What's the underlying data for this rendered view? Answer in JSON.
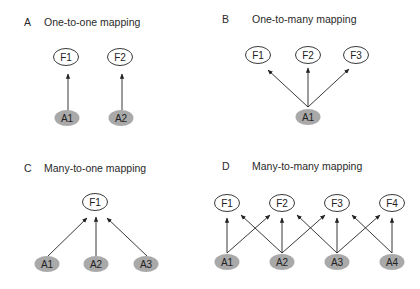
{
  "colors": {
    "node_outline": "#222222",
    "node_shaded_fill": "#a9a9a9",
    "arrow": "#222222"
  },
  "panels": [
    {
      "letter": "A",
      "title": "One-to-one mapping",
      "top_nodes": [
        "F1",
        "F2"
      ],
      "bottom_nodes": [
        "A1",
        "A2"
      ],
      "edges": [
        [
          "A1",
          "F1"
        ],
        [
          "A2",
          "F2"
        ]
      ]
    },
    {
      "letter": "B",
      "title": "One-to-many mapping",
      "top_nodes": [
        "F1",
        "F2",
        "F3"
      ],
      "bottom_nodes": [
        "A1"
      ],
      "edges": [
        [
          "A1",
          "F1"
        ],
        [
          "A1",
          "F2"
        ],
        [
          "A1",
          "F3"
        ]
      ]
    },
    {
      "letter": "C",
      "title": "Many-to-one mapping",
      "top_nodes": [
        "F1"
      ],
      "bottom_nodes": [
        "A1",
        "A2",
        "A3"
      ],
      "edges": [
        [
          "A1",
          "F1"
        ],
        [
          "A2",
          "F1"
        ],
        [
          "A3",
          "F1"
        ]
      ]
    },
    {
      "letter": "D",
      "title": "Many-to-many mapping",
      "top_nodes": [
        "F1",
        "F2",
        "F3",
        "F4"
      ],
      "bottom_nodes": [
        "A1",
        "A2",
        "A3",
        "A4"
      ],
      "edges": [
        [
          "A1",
          "F1"
        ],
        [
          "A1",
          "F2"
        ],
        [
          "A2",
          "F1"
        ],
        [
          "A2",
          "F2"
        ],
        [
          "A2",
          "F3"
        ],
        [
          "A3",
          "F2"
        ],
        [
          "A3",
          "F3"
        ],
        [
          "A3",
          "F4"
        ],
        [
          "A4",
          "F3"
        ],
        [
          "A4",
          "F4"
        ]
      ]
    }
  ]
}
